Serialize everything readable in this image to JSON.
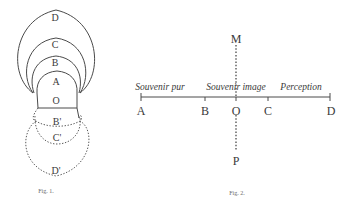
{
  "figure1": {
    "caption": "Fig. 1.",
    "labels": {
      "D": "D",
      "C": "C",
      "B": "B",
      "A": "A",
      "O": "O",
      "B_prime": "B'",
      "C_prime": "C'",
      "D_prime": "D'"
    }
  },
  "figure2": {
    "caption": "Fig. 2.",
    "points": {
      "A": "A",
      "B": "B",
      "O": "O",
      "C": "C",
      "D": "D",
      "M": "M",
      "P": "P"
    },
    "segments": {
      "souvenir_pur": "Souvenir pur",
      "souvenir_image": "Souvenir image",
      "perception": "Perception"
    }
  }
}
